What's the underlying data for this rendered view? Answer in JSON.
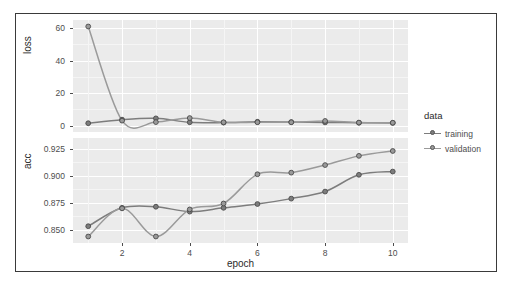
{
  "chart_data": {
    "type": "line",
    "title": "",
    "subtitle": "",
    "xlabel": "epoch",
    "ylabel": "",
    "legend_title": "data",
    "legend_position": "right",
    "grid": true,
    "x": [
      1,
      2,
      3,
      4,
      5,
      6,
      7,
      8,
      9,
      10
    ],
    "xlim": [
      0.55,
      10.45
    ],
    "xticks": [
      2,
      4,
      6,
      8,
      10
    ],
    "xtick_labels": [
      "2",
      "4",
      "6",
      "8",
      "10"
    ],
    "facets": [
      {
        "name": "loss",
        "ylabel": "loss",
        "ylim": [
          -4,
          65
        ],
        "yticks": [
          0,
          20,
          40,
          60
        ],
        "ytick_labels": [
          "0",
          "20",
          "40",
          "60"
        ],
        "series": [
          {
            "name": "training",
            "color": "#7d7d7d",
            "values": [
              1.4,
              3.6,
              4.4,
              2.0,
              1.8,
              2.3,
              2.1,
              1.9,
              1.7,
              1.6
            ]
          },
          {
            "name": "validation",
            "color": "#9a9a9a",
            "values": [
              61.0,
              3.0,
              2.1,
              4.6,
              2.0,
              2.0,
              2.0,
              2.8,
              1.8,
              1.7
            ]
          }
        ]
      },
      {
        "name": "acc",
        "ylabel": "acc",
        "ylim": [
          0.838,
          0.935
        ],
        "yticks": [
          0.85,
          0.875,
          0.9,
          0.925
        ],
        "ytick_labels": [
          "0.850",
          "0.875",
          "0.900",
          "0.925"
        ],
        "series": [
          {
            "name": "training",
            "color": "#7d7d7d",
            "values": [
              0.8535,
              0.8705,
              0.8715,
              0.867,
              0.8705,
              0.874,
              0.879,
              0.8855,
              0.901,
              0.904
            ]
          },
          {
            "name": "validation",
            "color": "#9a9a9a",
            "values": [
              0.844,
              0.87,
              0.844,
              0.869,
              0.8745,
              0.9015,
              0.903,
              0.91,
              0.9185,
              0.923
            ]
          }
        ]
      }
    ],
    "legend_entries": [
      {
        "label": "training",
        "color": "#7d7d7d"
      },
      {
        "label": "validation",
        "color": "#9a9a9a"
      }
    ],
    "colors": {
      "panel_background": "#ebebeb",
      "grid_major": "#ffffff",
      "grid_minor": "#f5f5f5",
      "frame": "#3a3a3a",
      "text": "#4d4d4d",
      "plot_background": "#ffffff"
    }
  }
}
